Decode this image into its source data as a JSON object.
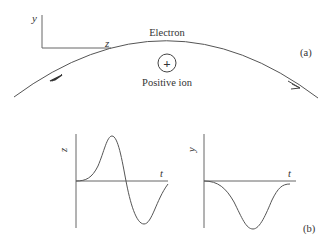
{
  "panel_a": {
    "tag": "(a)",
    "axis_y_label": "y",
    "axis_z_label": "z",
    "electron_label": "Electron",
    "ion_symbol": "+",
    "ion_label": "Positive ion"
  },
  "panel_b": {
    "tag": "(b)",
    "left_plot": {
      "y_label": "z",
      "x_label": "t"
    },
    "right_plot": {
      "y_label": "y",
      "x_label": "t"
    }
  },
  "colors": {
    "line": "#555555",
    "text": "#333333",
    "background": "#ffffff"
  }
}
